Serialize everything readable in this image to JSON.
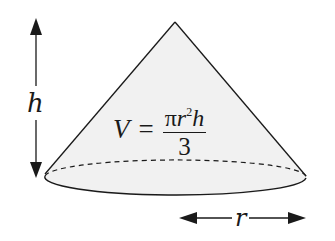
{
  "diagram": {
    "labels": {
      "height": "h",
      "radius": "r"
    },
    "formula": {
      "lhs": "V",
      "equals": "=",
      "numerator_pi": "π",
      "numerator_r": "r",
      "numerator_exp": "2",
      "numerator_h": "h",
      "denominator": "3"
    },
    "colors": {
      "fill": "#f0f0f0",
      "stroke": "#1a1a1a",
      "background": "#ffffff"
    }
  }
}
